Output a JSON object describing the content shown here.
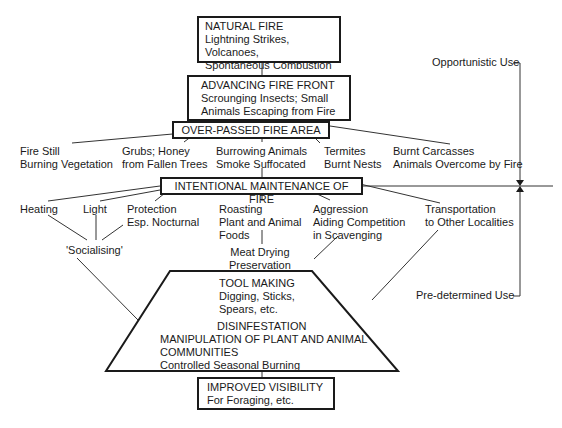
{
  "diagram": {
    "natural_fire": {
      "title": "NATURAL FIRE",
      "lines": [
        "Lightning Strikes, Volcanoes,",
        "Spontaneous Combustion"
      ]
    },
    "advancing_front": {
      "title": "ADVANCING FIRE FRONT",
      "lines": [
        "Scrounging Insects; Small",
        "Animals Escaping from Fire"
      ]
    },
    "over_passed": {
      "title": "OVER-PASSED FIRE AREA"
    },
    "over_passed_items": [
      {
        "lines": [
          "Fire Still",
          "Burning Vegetation"
        ]
      },
      {
        "lines": [
          "Grubs; Honey",
          "from Fallen Trees"
        ]
      },
      {
        "lines": [
          "Burrowing Animals",
          "Smoke Suffocated"
        ]
      },
      {
        "lines": [
          "Termites",
          "Burnt Nests"
        ]
      },
      {
        "lines": [
          "Burnt Carcasses",
          "Animals Overcome by Fire"
        ]
      }
    ],
    "intentional": {
      "title": "INTENTIONAL MAINTENANCE OF FIRE"
    },
    "intentional_items": [
      {
        "lines": [
          "Heating"
        ]
      },
      {
        "lines": [
          "Light"
        ]
      },
      {
        "lines": [
          "Protection",
          "Esp. Nocturnal"
        ]
      },
      {
        "lines": [
          "Roasting",
          "Plant and Animal",
          "Foods"
        ]
      },
      {
        "lines": [
          "Aggression",
          "Aiding Competition",
          "in Scavenging"
        ]
      },
      {
        "lines": [
          "Transportation",
          "to Other Localities"
        ]
      }
    ],
    "socialising": "'Socialising'",
    "meat_drying": {
      "lines": [
        "Meat Drying",
        "Preservation"
      ]
    },
    "trapezoid": {
      "tool_making": {
        "title": "TOOL MAKING",
        "lines": [
          "Digging, Sticks,",
          "Spears, etc."
        ]
      },
      "disinfestation": "DISINFESTATION",
      "manipulation": {
        "title_lines": [
          "MANIPULATION OF PLANT AND ANIMAL",
          "COMMUNITIES"
        ],
        "sub": "Controlled Seasonal Burning"
      }
    },
    "improved_visibility": {
      "title": "IMPROVED VISIBILITY",
      "lines": [
        "For Foraging, etc."
      ]
    },
    "side_labels": {
      "opportunistic": "Opportunistic Use",
      "predetermined": "Pre-determined Use"
    }
  }
}
